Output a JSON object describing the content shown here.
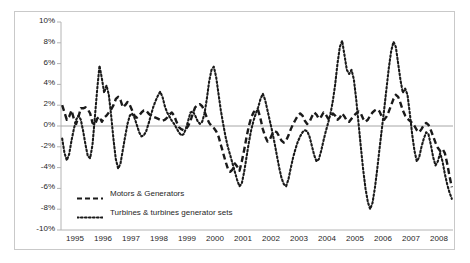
{
  "chart_data": {
    "type": "line",
    "title": "",
    "subtitle": "",
    "xlabel": "",
    "ylabel": "",
    "xlim": [
      1995,
      2009
    ],
    "ylim": [
      -10,
      10
    ],
    "grid": false,
    "zero_line": true,
    "legend_position": "inside-bottom-left",
    "y_tick_labels": [
      "10%",
      "8%",
      "6%",
      "4%",
      "2%",
      "0%",
      "-2%",
      "-4%",
      "-6%",
      "-8%",
      "-10%"
    ],
    "y_tick_values": [
      10,
      8,
      6,
      4,
      2,
      0,
      -2,
      -4,
      -6,
      -8,
      -10
    ],
    "x_tick_labels": [
      "1995",
      "1996",
      "1997",
      "1998",
      "1999",
      "2000",
      "2001",
      "2002",
      "2003",
      "2004",
      "2005",
      "2006",
      "2007",
      "2008"
    ],
    "x_tick_values": [
      1995,
      1996,
      1997,
      1998,
      1999,
      2000,
      2001,
      2002,
      2003,
      2004,
      2005,
      2006,
      2007,
      2008
    ],
    "series": [
      {
        "name": "Motors & Generators",
        "style": "dashed",
        "color": "#1a1a1a",
        "values": [
          2.0,
          1.3,
          0.6,
          0.9,
          1.5,
          0.7,
          0.2,
          0.9,
          1.7,
          1.7,
          1.8,
          1.6,
          1.2,
          0.3,
          0.1,
          0.7,
          0.9,
          0.4,
          0.8,
          1.0,
          1.3,
          1.6,
          2.0,
          2.6,
          2.8,
          2.5,
          1.8,
          2.0,
          2.3,
          2.0,
          1.5,
          1.0,
          0.8,
          1.0,
          1.3,
          1.5,
          1.5,
          1.2,
          1.0,
          0.9,
          0.8,
          0.7,
          0.6,
          0.5,
          0.6,
          0.8,
          1.1,
          1.3,
          1.0,
          0.4,
          -0.1,
          -0.3,
          -0.4,
          -0.3,
          0.0,
          0.5,
          1.2,
          1.8,
          2.0,
          2.1,
          1.9,
          1.4,
          0.8,
          0.3,
          0.0,
          -0.2,
          -0.5,
          -1.0,
          -1.8,
          -2.6,
          -3.4,
          -4.1,
          -4.4,
          -4.2,
          -3.6,
          -3.9,
          -4.3,
          -3.4,
          -2.3,
          -1.1,
          0.0,
          0.8,
          1.3,
          1.6,
          1.5,
          0.7,
          -0.3,
          -1.0,
          -1.5,
          -1.3,
          -0.8,
          -0.5,
          -0.6,
          -1.0,
          -1.4,
          -1.6,
          -1.4,
          -0.9,
          -0.3,
          0.2,
          0.6,
          1.0,
          1.2,
          1.0,
          0.5,
          0.2,
          0.4,
          0.9,
          1.3,
          1.1,
          0.7,
          0.9,
          1.3,
          1.1,
          0.7,
          0.9,
          1.2,
          1.0,
          0.6,
          0.8,
          1.2,
          0.9,
          0.5,
          0.4,
          0.7,
          1.0,
          1.2,
          1.4,
          1.2,
          0.7,
          0.4,
          0.6,
          1.0,
          1.3,
          1.5,
          1.6,
          1.4,
          0.9,
          0.6,
          0.9,
          1.4,
          2.0,
          2.6,
          3.0,
          2.8,
          2.2,
          1.5,
          1.0,
          0.7,
          0.5,
          0.3,
          0.0,
          -0.4,
          -0.6,
          -0.3,
          0.1,
          0.3,
          0.1,
          -0.4,
          -1.0,
          -1.6,
          -2.1,
          -2.4,
          -2.2,
          -2.6,
          -3.6,
          -4.8,
          -5.9
        ]
      },
      {
        "name": "Turbines & turbines generator sets",
        "style": "dotted",
        "color": "#1a1a1a",
        "values": [
          -1.2,
          -2.6,
          -3.3,
          -2.7,
          -1.4,
          -0.3,
          0.6,
          1.0,
          0.6,
          -0.5,
          -1.8,
          -2.9,
          -3.1,
          -1.8,
          0.8,
          3.5,
          5.8,
          4.6,
          3.2,
          3.9,
          3.0,
          1.0,
          -1.3,
          -3.2,
          -4.1,
          -3.6,
          -2.3,
          -1.0,
          0.2,
          1.0,
          1.2,
          0.8,
          0.1,
          -0.6,
          -1.0,
          -0.9,
          -0.5,
          0.2,
          1.0,
          1.8,
          2.4,
          2.9,
          3.3,
          2.8,
          1.9,
          1.3,
          0.9,
          0.5,
          0.2,
          -0.2,
          -0.6,
          -0.9,
          -0.8,
          -0.3,
          0.5,
          1.3,
          1.4,
          1.0,
          0.5,
          0.2,
          0.4,
          1.2,
          2.6,
          4.3,
          5.4,
          5.7,
          4.7,
          3.1,
          1.5,
          0.2,
          -1.0,
          -2.0,
          -2.8,
          -3.6,
          -4.4,
          -5.2,
          -5.8,
          -5.5,
          -4.4,
          -3.0,
          -1.6,
          -0.4,
          0.5,
          1.2,
          1.8,
          2.6,
          3.1,
          2.5,
          1.5,
          0.5,
          -0.5,
          -1.6,
          -2.8,
          -4.0,
          -5.0,
          -5.6,
          -5.8,
          -5.1,
          -4.0,
          -3.0,
          -2.2,
          -1.5,
          -1.0,
          -0.6,
          -0.4,
          -0.5,
          -1.0,
          -1.9,
          -2.8,
          -3.4,
          -3.2,
          -2.4,
          -1.4,
          -0.5,
          0.3,
          1.2,
          2.4,
          4.0,
          6.0,
          7.6,
          8.2,
          6.8,
          5.4,
          5.0,
          5.4,
          4.5,
          2.6,
          0.3,
          -2.0,
          -4.2,
          -6.0,
          -7.3,
          -8.0,
          -7.4,
          -6.0,
          -4.2,
          -2.2,
          -0.3,
          1.6,
          3.6,
          5.6,
          7.2,
          8.1,
          7.6,
          6.0,
          4.4,
          3.2,
          3.6,
          3.0,
          1.2,
          -0.8,
          -2.4,
          -3.4,
          -3.0,
          -2.0,
          -1.2,
          -0.6,
          -0.8,
          -1.8,
          -3.0,
          -3.8,
          -3.4,
          -2.6,
          -3.4,
          -4.6,
          -5.6,
          -6.4,
          -7.0
        ]
      }
    ]
  },
  "legend": {
    "items": [
      {
        "label": "Motors & Generators",
        "style": "dashed"
      },
      {
        "label": "Turbines & turbines generator sets",
        "style": "dotted"
      }
    ]
  }
}
